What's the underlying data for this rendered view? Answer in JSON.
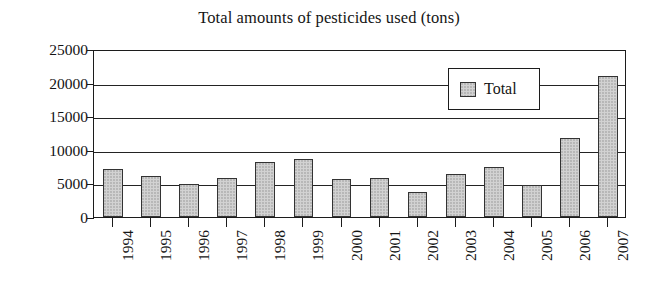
{
  "chart_data": {
    "type": "bar",
    "title": "Total amounts of pesticides used (tons)",
    "xlabel": "",
    "ylabel": "",
    "categories": [
      "1994",
      "1995",
      "1996",
      "1997",
      "1998",
      "1999",
      "2000",
      "2001",
      "2002",
      "2003",
      "2004",
      "2005",
      "2006",
      "2007"
    ],
    "series": [
      {
        "name": "Total",
        "values": [
          7200,
          6100,
          4900,
          5800,
          8200,
          8700,
          5600,
          5800,
          3700,
          6400,
          7500,
          4700,
          11700,
          21000
        ]
      }
    ],
    "values": [
      7200,
      6100,
      4900,
      5800,
      8200,
      8700,
      5600,
      5800,
      3700,
      6400,
      7500,
      4700,
      11700,
      21000
    ],
    "ylim": [
      0,
      25000
    ],
    "yticks": [
      0,
      5000,
      10000,
      15000,
      20000,
      25000
    ],
    "ytick_labels": [
      "0",
      "5000",
      "10000",
      "15000",
      "20000",
      "25000"
    ],
    "grid": true,
    "legend": {
      "position": "top-right-inside",
      "entries": [
        {
          "label": "Total",
          "swatch_color": "#d2d2d2",
          "swatch_border": "#333333"
        }
      ]
    },
    "style": {
      "bar_fill": "#d2d2d2",
      "bar_border": "#333333",
      "axis_color": "#1c1c1c",
      "background": "#ffffff",
      "text_color": "#141414"
    }
  }
}
